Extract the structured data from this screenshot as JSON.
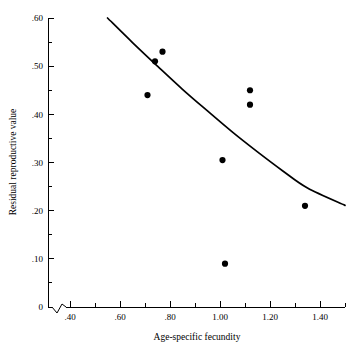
{
  "chart_data": {
    "type": "scatter",
    "title": "",
    "xlabel": "Age-specific fecundity",
    "ylabel": "Residual reproductive value",
    "xlim": [
      0.33,
      1.5
    ],
    "ylim": [
      0.0,
      0.6
    ],
    "grid": false,
    "legend": null,
    "axis_break_x": true,
    "x_ticks": [
      {
        "value": 0.4,
        "label": ".40"
      },
      {
        "value": 0.6,
        "label": ".60"
      },
      {
        "value": 0.8,
        "label": ".80"
      },
      {
        "value": 1.0,
        "label": "1.00"
      },
      {
        "value": 1.2,
        "label": "1.20"
      },
      {
        "value": 1.4,
        "label": "1.40"
      }
    ],
    "x_minor_ticks": [
      0.5,
      0.7,
      0.9,
      1.1,
      1.3,
      1.5
    ],
    "y_ticks": [
      {
        "value": 0.6,
        "label": ".60"
      },
      {
        "value": 0.5,
        "label": ".50"
      },
      {
        "value": 0.4,
        "label": ".40"
      },
      {
        "value": 0.3,
        "label": ".30"
      },
      {
        "value": 0.2,
        "label": ".20"
      },
      {
        "value": 0.1,
        "label": ".10"
      },
      {
        "value": 0.0,
        "label": "0"
      }
    ],
    "y_minor_ticks": [
      0.55,
      0.45,
      0.35,
      0.25,
      0.15,
      0.05
    ],
    "points": [
      {
        "x": 0.71,
        "y": 0.44
      },
      {
        "x": 0.74,
        "y": 0.51
      },
      {
        "x": 0.77,
        "y": 0.53
      },
      {
        "x": 1.01,
        "y": 0.305
      },
      {
        "x": 1.02,
        "y": 0.09
      },
      {
        "x": 1.12,
        "y": 0.45
      },
      {
        "x": 1.12,
        "y": 0.42
      },
      {
        "x": 1.34,
        "y": 0.21
      }
    ],
    "fit_curve": {
      "name": "fitted-trend",
      "points": [
        {
          "x": 0.55,
          "y": 0.6
        },
        {
          "x": 0.65,
          "y": 0.549
        },
        {
          "x": 0.75,
          "y": 0.5
        },
        {
          "x": 0.85,
          "y": 0.452
        },
        {
          "x": 0.95,
          "y": 0.407
        },
        {
          "x": 1.05,
          "y": 0.363
        },
        {
          "x": 1.15,
          "y": 0.322
        },
        {
          "x": 1.25,
          "y": 0.283
        },
        {
          "x": 1.35,
          "y": 0.247
        },
        {
          "x": 1.5,
          "y": 0.211
        }
      ]
    }
  }
}
